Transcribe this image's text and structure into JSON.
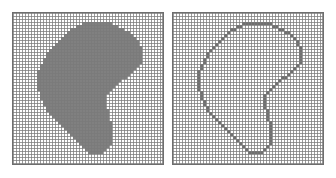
{
  "figure": {
    "title": "Rasterized region and its boundary",
    "background_color": "#ffffff",
    "width": 336,
    "height": 178
  },
  "panels": [
    {
      "id": "filled",
      "label": "Filled region",
      "mode": "fill",
      "x": 12,
      "y": 12,
      "width": 152,
      "height": 153,
      "grid": {
        "columns": 50,
        "rows": 50,
        "cell_px": 3,
        "line_color": "#7a7a7a",
        "line_width": 1,
        "background_color": "#ffffff",
        "visible": true
      },
      "border_color": "#6e6e6e",
      "cell_fill_color": "#808080"
    },
    {
      "id": "outline",
      "label": "Boundary outline",
      "mode": "outline",
      "x": 172,
      "y": 12,
      "width": 152,
      "height": 153,
      "grid": {
        "columns": 50,
        "rows": 50,
        "cell_px": 3,
        "line_color": "#7a7a7a",
        "line_width": 1,
        "background_color": "#ffffff",
        "visible": true
      },
      "border_color": "#6e6e6e",
      "cell_fill_color": "#707070"
    }
  ],
  "chart_data": {
    "type": "heatmap",
    "title": "Rasterized region and its boundary",
    "xlabel": "",
    "ylabel": "",
    "grid": true,
    "legend": "none",
    "columns": 50,
    "rows": 50,
    "value_legend": {
      "0": "empty cell",
      "1": "region cell"
    },
    "colors": {
      "empty": "#ffffff",
      "filled": "#808080",
      "grid": "#7a7a7a",
      "border": "#6e6e6e"
    },
    "note": "Right panel shows the 1-cell-wide boundary of the left panel region.",
    "region_row_spans": [
      {
        "row": 3,
        "spans": [
          [
            23,
            32
          ]
        ]
      },
      {
        "row": 4,
        "spans": [
          [
            21,
            34
          ]
        ]
      },
      {
        "row": 5,
        "spans": [
          [
            19,
            36
          ]
        ]
      },
      {
        "row": 6,
        "spans": [
          [
            18,
            38
          ]
        ]
      },
      {
        "row": 7,
        "spans": [
          [
            17,
            39
          ]
        ]
      },
      {
        "row": 8,
        "spans": [
          [
            16,
            40
          ]
        ]
      },
      {
        "row": 9,
        "spans": [
          [
            15,
            41
          ]
        ]
      },
      {
        "row": 10,
        "spans": [
          [
            14,
            41
          ]
        ]
      },
      {
        "row": 11,
        "spans": [
          [
            13,
            42
          ]
        ]
      },
      {
        "row": 12,
        "spans": [
          [
            12,
            42
          ]
        ]
      },
      {
        "row": 13,
        "spans": [
          [
            11,
            42
          ]
        ]
      },
      {
        "row": 14,
        "spans": [
          [
            11,
            42
          ]
        ]
      },
      {
        "row": 15,
        "spans": [
          [
            10,
            42
          ]
        ]
      },
      {
        "row": 16,
        "spans": [
          [
            10,
            42
          ]
        ]
      },
      {
        "row": 17,
        "spans": [
          [
            9,
            41
          ]
        ]
      },
      {
        "row": 18,
        "spans": [
          [
            9,
            40
          ]
        ]
      },
      {
        "row": 19,
        "spans": [
          [
            8,
            39
          ]
        ]
      },
      {
        "row": 20,
        "spans": [
          [
            8,
            38
          ]
        ]
      },
      {
        "row": 21,
        "spans": [
          [
            8,
            37
          ]
        ]
      },
      {
        "row": 22,
        "spans": [
          [
            8,
            35
          ]
        ]
      },
      {
        "row": 23,
        "spans": [
          [
            8,
            34
          ]
        ]
      },
      {
        "row": 24,
        "spans": [
          [
            8,
            33
          ]
        ]
      },
      {
        "row": 25,
        "spans": [
          [
            8,
            32
          ]
        ]
      },
      {
        "row": 26,
        "spans": [
          [
            9,
            31
          ]
        ]
      },
      {
        "row": 27,
        "spans": [
          [
            9,
            30
          ]
        ]
      },
      {
        "row": 28,
        "spans": [
          [
            9,
            30
          ]
        ]
      },
      {
        "row": 29,
        "spans": [
          [
            10,
            30
          ]
        ]
      },
      {
        "row": 30,
        "spans": [
          [
            10,
            30
          ]
        ]
      },
      {
        "row": 31,
        "spans": [
          [
            11,
            30
          ]
        ]
      },
      {
        "row": 32,
        "spans": [
          [
            11,
            31
          ]
        ]
      },
      {
        "row": 33,
        "spans": [
          [
            12,
            31
          ]
        ]
      },
      {
        "row": 34,
        "spans": [
          [
            13,
            31
          ]
        ]
      },
      {
        "row": 35,
        "spans": [
          [
            14,
            31
          ]
        ]
      },
      {
        "row": 36,
        "spans": [
          [
            15,
            32
          ]
        ]
      },
      {
        "row": 37,
        "spans": [
          [
            16,
            32
          ]
        ]
      },
      {
        "row": 38,
        "spans": [
          [
            17,
            32
          ]
        ]
      },
      {
        "row": 39,
        "spans": [
          [
            18,
            32
          ]
        ]
      },
      {
        "row": 40,
        "spans": [
          [
            19,
            32
          ]
        ]
      },
      {
        "row": 41,
        "spans": [
          [
            20,
            32
          ]
        ]
      },
      {
        "row": 42,
        "spans": [
          [
            21,
            32
          ]
        ]
      },
      {
        "row": 43,
        "spans": [
          [
            22,
            32
          ]
        ]
      },
      {
        "row": 44,
        "spans": [
          [
            23,
            31
          ]
        ]
      },
      {
        "row": 45,
        "spans": [
          [
            24,
            30
          ]
        ]
      },
      {
        "row": 46,
        "spans": [
          [
            25,
            29
          ]
        ]
      }
    ]
  }
}
